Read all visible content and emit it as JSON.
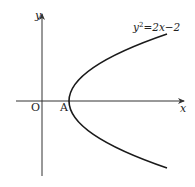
{
  "figure": {
    "type": "coordinate-diagram",
    "curve": {
      "name": "parabola",
      "equation_lhs": "y",
      "equation_exp": "2",
      "equation_rhs": "=2x−2",
      "vertex": [
        1,
        0
      ],
      "opens": "right"
    },
    "axes": {
      "x_label": "x",
      "y_label": "y",
      "origin_label": "O"
    },
    "points": [
      {
        "label": "A",
        "coords": [
          1,
          0
        ],
        "description": "vertex of parabola on x-axis"
      }
    ],
    "colors": {
      "stroke": "#1a1a1a",
      "axis": "#333333",
      "background": "#ffffff"
    }
  }
}
